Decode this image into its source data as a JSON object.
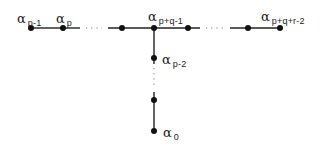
{
  "diagram": {
    "type": "dynkin-like-tree",
    "colors": {
      "line": "#222222",
      "node": "#111111",
      "dots": "#666666",
      "background": "#ffffff"
    },
    "symbol": "α",
    "labels": {
      "n_p_minus_1": {
        "base": "α",
        "sub": "p-1"
      },
      "n_p": {
        "base": "α",
        "sub": "p"
      },
      "n_junction": {
        "base": "α",
        "sub": "p+q-1"
      },
      "n_end_right": {
        "base": "α",
        "sub": "p+q+r-2"
      },
      "n_p_minus_2": {
        "base": "α",
        "sub": "p-2"
      },
      "n_zero": {
        "base": "α",
        "sub": "0"
      }
    },
    "nodes": [
      {
        "id": "n_p_minus_1",
        "x": 31,
        "y": 28,
        "label": "α p-1"
      },
      {
        "id": "n_p",
        "x": 63,
        "y": 28,
        "label": "α p"
      },
      {
        "id": "n_left_of_junction",
        "x": 122,
        "y": 28,
        "label": ""
      },
      {
        "id": "n_junction",
        "x": 154,
        "y": 28,
        "label": "α p+q-1"
      },
      {
        "id": "n_right_of_junction",
        "x": 188,
        "y": 28,
        "label": ""
      },
      {
        "id": "n_before_end",
        "x": 248,
        "y": 28,
        "label": ""
      },
      {
        "id": "n_end_right",
        "x": 280,
        "y": 28,
        "label": "α p+q+r-2"
      },
      {
        "id": "n_p_minus_2",
        "x": 154,
        "y": 58,
        "label": "α p-2"
      },
      {
        "id": "n_above_zero",
        "x": 154,
        "y": 100,
        "label": ""
      },
      {
        "id": "n_zero",
        "x": 154,
        "y": 131,
        "label": "α 0"
      }
    ],
    "edges": [
      {
        "from": "n_p_minus_1",
        "to": "n_p",
        "style": "solid"
      },
      {
        "from": "n_p",
        "to": "n_left_of_junction",
        "style": "ellipsis"
      },
      {
        "from": "n_left_of_junction",
        "to": "n_junction",
        "style": "solid"
      },
      {
        "from": "n_junction",
        "to": "n_right_of_junction",
        "style": "solid"
      },
      {
        "from": "n_right_of_junction",
        "to": "n_before_end",
        "style": "ellipsis"
      },
      {
        "from": "n_before_end",
        "to": "n_end_right",
        "style": "solid"
      },
      {
        "from": "n_junction",
        "to": "n_p_minus_2",
        "style": "solid"
      },
      {
        "from": "n_p_minus_2",
        "to": "n_above_zero",
        "style": "ellipsis"
      },
      {
        "from": "n_above_zero",
        "to": "n_zero",
        "style": "solid"
      }
    ]
  }
}
